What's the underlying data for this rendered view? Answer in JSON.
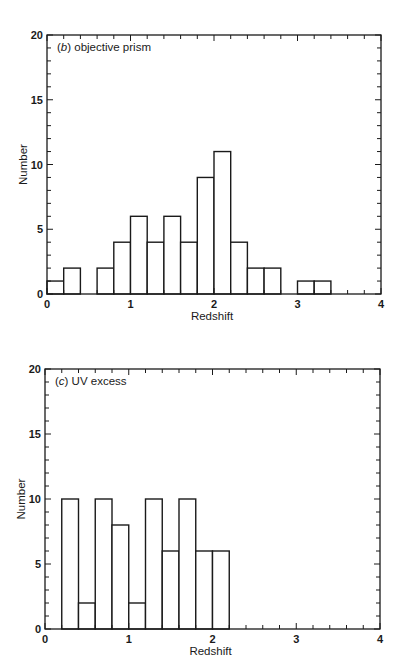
{
  "chart_data": [
    {
      "type": "bar",
      "subtype": "histogram",
      "panel": "(b)",
      "title": "objective prism",
      "xlabel": "Redshift",
      "ylabel": "Number",
      "xlim": [
        0,
        4
      ],
      "ylim": [
        0,
        20
      ],
      "xticks": [
        "0",
        "1",
        "2",
        "3",
        "4"
      ],
      "yticks": [
        "0",
        "5",
        "10",
        "15",
        "20"
      ],
      "bin_width": 0.2,
      "bins": [
        {
          "x0": 0.0,
          "x1": 0.2,
          "count": 1
        },
        {
          "x0": 0.2,
          "x1": 0.4,
          "count": 2
        },
        {
          "x0": 0.4,
          "x1": 0.6,
          "count": 0
        },
        {
          "x0": 0.6,
          "x1": 0.8,
          "count": 2
        },
        {
          "x0": 0.8,
          "x1": 1.0,
          "count": 4
        },
        {
          "x0": 1.0,
          "x1": 1.2,
          "count": 6
        },
        {
          "x0": 1.2,
          "x1": 1.4,
          "count": 4
        },
        {
          "x0": 1.4,
          "x1": 1.6,
          "count": 6
        },
        {
          "x0": 1.6,
          "x1": 1.8,
          "count": 4
        },
        {
          "x0": 1.8,
          "x1": 2.0,
          "count": 9
        },
        {
          "x0": 2.0,
          "x1": 2.2,
          "count": 11
        },
        {
          "x0": 2.2,
          "x1": 2.4,
          "count": 4
        },
        {
          "x0": 2.4,
          "x1": 2.6,
          "count": 2
        },
        {
          "x0": 2.6,
          "x1": 2.8,
          "count": 2
        },
        {
          "x0": 2.8,
          "x1": 3.0,
          "count": 0
        },
        {
          "x0": 3.0,
          "x1": 3.2,
          "count": 1
        },
        {
          "x0": 3.2,
          "x1": 3.4,
          "count": 1
        }
      ],
      "grid": false,
      "legend": null
    },
    {
      "type": "bar",
      "subtype": "histogram",
      "panel": "(c)",
      "title": "UV excess",
      "xlabel": "Redshift",
      "ylabel": "Number",
      "xlim": [
        0,
        4
      ],
      "ylim": [
        0,
        20
      ],
      "xticks": [
        "0",
        "1",
        "2",
        "3",
        "4"
      ],
      "yticks": [
        "0",
        "5",
        "10",
        "15",
        "20"
      ],
      "bin_width": 0.2,
      "bins": [
        {
          "x0": 0.2,
          "x1": 0.4,
          "count": 10
        },
        {
          "x0": 0.4,
          "x1": 0.6,
          "count": 2
        },
        {
          "x0": 0.6,
          "x1": 0.8,
          "count": 10
        },
        {
          "x0": 0.8,
          "x1": 1.0,
          "count": 8
        },
        {
          "x0": 1.0,
          "x1": 1.2,
          "count": 2
        },
        {
          "x0": 1.2,
          "x1": 1.4,
          "count": 10
        },
        {
          "x0": 1.4,
          "x1": 1.6,
          "count": 6
        },
        {
          "x0": 1.6,
          "x1": 1.8,
          "count": 10
        },
        {
          "x0": 1.8,
          "x1": 2.0,
          "count": 6
        },
        {
          "x0": 2.0,
          "x1": 2.2,
          "count": 6
        }
      ],
      "grid": false,
      "legend": null
    }
  ],
  "panels": {
    "b": {
      "letter": "b",
      "label_prefix": "(",
      "label_suffix": ")",
      "title": "objective prism"
    },
    "c": {
      "letter": "c",
      "label_prefix": "(",
      "label_suffix": ")",
      "title": "UV excess"
    }
  },
  "axes": {
    "xlabel": "Redshift",
    "ylabel": "Number"
  }
}
